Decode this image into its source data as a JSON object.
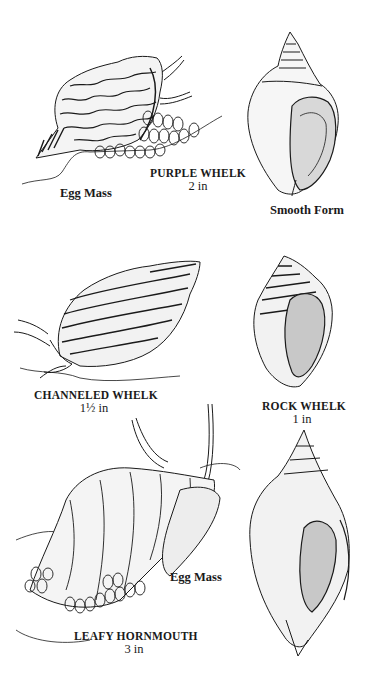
{
  "plate": {
    "type": "field-guide illustration",
    "style": "black ink stipple line drawing on white"
  },
  "specimens": [
    {
      "id": "purple-whelk",
      "name": "PURPLE WHELK",
      "size": "2 in",
      "annotations": [
        "Egg Mass"
      ]
    },
    {
      "id": "purple-whelk-smooth",
      "caption": "Smooth Form"
    },
    {
      "id": "channeled-whelk",
      "name": "CHANNELED WHELK",
      "size": "1½ in"
    },
    {
      "id": "rock-whelk",
      "name": "ROCK WHELK",
      "size": "1 in"
    },
    {
      "id": "leafy-hornmouth",
      "name": "LEAFY HORNMOUTH",
      "size": "3 in",
      "annotations": [
        "Egg Mass"
      ]
    }
  ],
  "colors": {
    "ink": "#1a1a1a",
    "paper": "#ffffff",
    "stipple": "#9a9a9a"
  }
}
